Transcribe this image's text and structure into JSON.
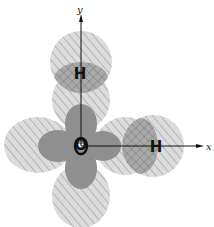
{
  "diagram": {
    "axes": {
      "x_label": "x",
      "y_label": "y"
    },
    "atoms": {
      "center": "O",
      "hydrogen_top": "H",
      "hydrogen_right": "H"
    },
    "colors": {
      "outer_lobe": "#d6d6d6",
      "inner_lobe": "#8f8f8f",
      "hatch": "#9a9a9a",
      "overlap": "#a8a8a8",
      "axis": "#111111"
    }
  }
}
